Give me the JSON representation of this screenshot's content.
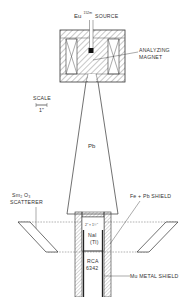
{
  "figure": {
    "labels": {
      "source_element": "Eu",
      "source_isotope": "152m",
      "source_word": "SOURCE",
      "magnet_line1": "ANALYZING",
      "magnet_line2": "MAGNET",
      "scale_title": "SCALE",
      "scale_unit": "1\"",
      "lead_cone": "Pb",
      "scatterer_line1": "Sm₂ O₃",
      "scatterer_line2": "SCATTERER",
      "shield": "Fe + Pb SHIELD",
      "crystal_size": "2\" × 1½\"",
      "crystal_line1": "NaI",
      "crystal_line2": "(Tl)",
      "pmt_line1": "RCA",
      "pmt_line2": "6342",
      "mu_shield": "Mu METAL SHIELD"
    },
    "colors": {
      "ink": "#333333",
      "background": "#ffffff"
    }
  }
}
